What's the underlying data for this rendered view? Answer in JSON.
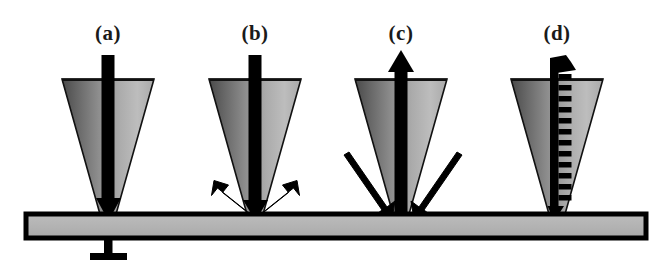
{
  "figure": {
    "background_color": "#ffffff",
    "width": 672,
    "height": 271
  },
  "panels": [
    {
      "id": "a",
      "label": "(a)",
      "label_x": 108,
      "label_y": 40,
      "description": "Conical probe tip with a solid vertical arrow directed downward through the tip onto the substrate",
      "tip_center_x": 108,
      "arrow_mode": "down-solid"
    },
    {
      "id": "b",
      "label": "(b)",
      "label_x": 255,
      "label_y": 40,
      "description": "Conical probe tip with downward arrow and two arrows splaying outward and upward from the contact point",
      "tip_center_x": 255,
      "arrow_mode": "down-solid-with-outgoing-splay"
    },
    {
      "id": "c",
      "label": "(c)",
      "label_x": 401,
      "label_y": 40,
      "description": "Conical probe tip with an upward arrow exiting the top and two thick arrows converging inward and downward onto the contact point",
      "tip_center_x": 401,
      "arrow_mode": "up-solid-with-incoming-splay"
    },
    {
      "id": "d",
      "label": "(d)",
      "label_x": 557,
      "label_y": 40,
      "description": "Conical probe tip with a ladder-style rung arrow directed upward out of the tip",
      "tip_center_x": 557,
      "arrow_mode": "up-ladder"
    }
  ],
  "substrate": {
    "name": "sample-substrate-bar",
    "fill_color": "#b3b3b3",
    "stroke_color": "#000000",
    "x": 26,
    "y": 214,
    "width": 620,
    "height": 24
  },
  "ground_symbol": {
    "name": "ground-symbol",
    "description": "Electrical ground connection beneath the substrate",
    "stem_x": 108,
    "stem_top": 238,
    "stem_bottom": 258,
    "bar_half_width": 18,
    "color": "#000000"
  },
  "cone": {
    "name": "probe-tip-cone",
    "top_half_width": 46,
    "bottom_half_width": 7,
    "top_y": 79,
    "bottom_y": 216,
    "gradient_from": "#4f4f4f",
    "gradient_mid": "#8c8c8c",
    "gradient_to": "#c2c2c2",
    "stroke_color": "#000000"
  },
  "colors": {
    "ink": "#000000",
    "label_ink": "#1a1a1a",
    "paper": "#ffffff",
    "cone_dark": "#4f4f4f",
    "cone_light": "#c2c2c2",
    "substrate_gray": "#b3b3b3"
  }
}
